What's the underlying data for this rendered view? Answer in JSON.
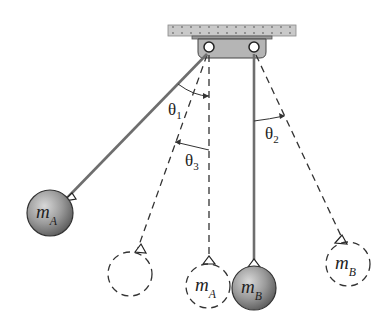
{
  "figure": {
    "colors": {
      "ceiling": "#c9c9c9",
      "bracket": "#b5b5b5",
      "ball_fill": "#8a8a8a",
      "ball_highlight": "#d8d8d8",
      "rod": "#6e6e6e",
      "dashed": "#333333"
    }
  },
  "labels": {
    "mass_a_solid": {
      "main": "m",
      "sub": "A"
    },
    "mass_a_dashed": {
      "main": "m",
      "sub": "A"
    },
    "mass_b_solid": {
      "main": "m",
      "sub": "B"
    },
    "mass_b_dashed": {
      "main": "m",
      "sub": "B"
    }
  },
  "angles": {
    "theta1": {
      "main": "θ",
      "sub": "1"
    },
    "theta2": {
      "main": "θ",
      "sub": "2"
    },
    "theta3": {
      "main": "θ",
      "sub": "3"
    }
  }
}
